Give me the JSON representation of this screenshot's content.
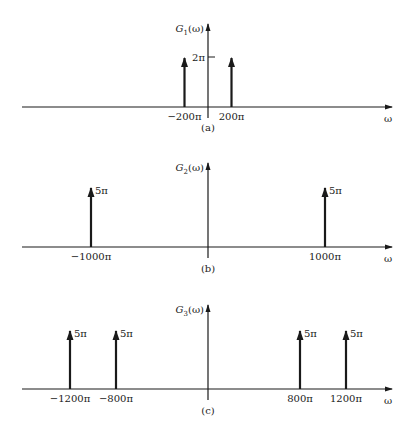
{
  "chart_data": [
    {
      "type": "impulse",
      "id": "a",
      "caption": "(a)",
      "ylabel": "G₁(ω)",
      "ylabel_base": "G",
      "ylabel_sub": "1",
      "ylabel_arg": "(ω)",
      "xlabel": "ω",
      "y_tick_label": "2π",
      "y_tick_value": 2,
      "impulses": [
        {
          "x": -200,
          "x_label": "−200π",
          "amplitude": 2,
          "amp_label": ""
        },
        {
          "x": 200,
          "x_label": "200π",
          "amplitude": 2,
          "amp_label": ""
        }
      ]
    },
    {
      "type": "impulse",
      "id": "b",
      "caption": "(b)",
      "ylabel": "G₂(ω)",
      "ylabel_base": "G",
      "ylabel_sub": "2",
      "ylabel_arg": "(ω)",
      "xlabel": "ω",
      "impulses": [
        {
          "x": -1000,
          "x_label": "−1000π",
          "amplitude": 5,
          "amp_label": "5π"
        },
        {
          "x": 1000,
          "x_label": "1000π",
          "amplitude": 5,
          "amp_label": "5π"
        }
      ]
    },
    {
      "type": "impulse",
      "id": "c",
      "caption": "(c)",
      "ylabel": "G₃(ω)",
      "ylabel_base": "G",
      "ylabel_sub": "3",
      "ylabel_arg": "(ω)",
      "xlabel": "ω",
      "impulses": [
        {
          "x": -1200,
          "x_label": "−1200π",
          "amplitude": 5,
          "amp_label": "5π"
        },
        {
          "x": -800,
          "x_label": "−800π",
          "amplitude": 5,
          "amp_label": "5π"
        },
        {
          "x": 800,
          "x_label": "800π",
          "amplitude": 5,
          "amp_label": "5π"
        },
        {
          "x": 1200,
          "x_label": "1200π",
          "amplitude": 5,
          "amp_label": "5π"
        }
      ]
    }
  ]
}
